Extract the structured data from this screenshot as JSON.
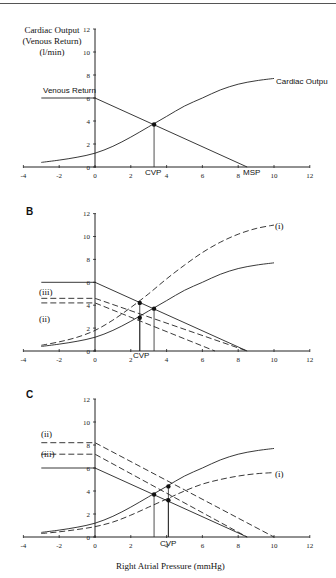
{
  "chart_data": [
    {
      "panel": "A",
      "type": "line",
      "ylabel": "Cardiac Output (Venous Return) (l/min)",
      "xlabel": "",
      "xlim": [
        -4,
        12
      ],
      "ylim": [
        0,
        12
      ],
      "xticks": [
        -4,
        -2,
        0,
        2,
        4,
        6,
        8,
        10,
        12
      ],
      "yticks": [
        0,
        2,
        4,
        6,
        8,
        10,
        12
      ],
      "grid": false,
      "series": [
        {
          "name": "Venous Return",
          "style": "solid",
          "x": [
            -3,
            0,
            8.5
          ],
          "y": [
            6,
            6,
            0
          ]
        },
        {
          "name": "Cardiac Output",
          "style": "solid",
          "x": [
            -3,
            -2,
            -1,
            0,
            1,
            2,
            3,
            4,
            5,
            6,
            7,
            8,
            9,
            10
          ],
          "y": [
            0.4,
            0.6,
            0.85,
            1.2,
            1.8,
            2.6,
            3.5,
            4.4,
            5.3,
            6.0,
            6.7,
            7.2,
            7.5,
            7.7
          ]
        }
      ],
      "annotations": [
        {
          "text": "Venous Return",
          "x": -3,
          "y": 6
        },
        {
          "text": "Cardiac Output",
          "x": 10,
          "y": 7.7
        },
        {
          "text": "CVP",
          "x": 3.3,
          "y": 0
        },
        {
          "text": "MSP",
          "x": 8.5,
          "y": 0
        }
      ],
      "points": [
        {
          "x": 3.3,
          "y": 3.7
        }
      ]
    },
    {
      "panel": "B",
      "type": "line",
      "xlim": [
        -4,
        12
      ],
      "ylim": [
        0,
        12
      ],
      "xticks": [
        -4,
        -2,
        0,
        2,
        4,
        6,
        8,
        10,
        12
      ],
      "yticks": [
        0,
        2,
        4,
        6,
        8,
        10,
        12
      ],
      "grid": false,
      "series": [
        {
          "name": "Venous Return",
          "style": "solid",
          "x": [
            -3,
            0,
            8.5
          ],
          "y": [
            6,
            6,
            0
          ]
        },
        {
          "name": "Cardiac Output",
          "style": "solid",
          "x": [
            -3,
            -2,
            -1,
            0,
            1,
            2,
            3,
            4,
            5,
            6,
            7,
            8,
            9,
            10
          ],
          "y": [
            0.4,
            0.6,
            0.85,
            1.2,
            1.8,
            2.6,
            3.5,
            4.4,
            5.3,
            6.0,
            6.7,
            7.2,
            7.5,
            7.7
          ]
        },
        {
          "name": "(i)",
          "style": "dashed",
          "x": [
            -3,
            -2,
            -1,
            0,
            1,
            2,
            3,
            4,
            5,
            6,
            7,
            8,
            9,
            10
          ],
          "y": [
            0.5,
            0.8,
            1.2,
            1.8,
            2.7,
            3.8,
            5.0,
            6.3,
            7.5,
            8.6,
            9.5,
            10.2,
            10.7,
            11.0
          ]
        },
        {
          "name": "(ii)",
          "style": "dashed",
          "x": [
            -3,
            0,
            6.7
          ],
          "y": [
            4.2,
            4.2,
            0
          ]
        },
        {
          "name": "(iii)",
          "style": "dashed",
          "x": [
            -3,
            0,
            8.5
          ],
          "y": [
            4.6,
            4.6,
            0
          ]
        }
      ],
      "annotations": [
        {
          "text": "(i)",
          "x": 10.3,
          "y": 11.0
        },
        {
          "text": "(ii)",
          "x": -3,
          "y": 3.5
        },
        {
          "text": "(iii)",
          "x": -3,
          "y": 5.2
        },
        {
          "text": "CVP",
          "x": 2.8,
          "y": 0
        }
      ],
      "points": [
        {
          "x": 2.5,
          "y": 4.2
        },
        {
          "x": 2.5,
          "y": 2.9
        },
        {
          "x": 3.3,
          "y": 3.7
        }
      ]
    },
    {
      "panel": "C",
      "type": "line",
      "xlabel": "Right Atrial Pressure (mmHg)",
      "xlim": [
        -4,
        12
      ],
      "ylim": [
        0,
        12
      ],
      "xticks": [
        -4,
        -2,
        0,
        2,
        4,
        6,
        8,
        10,
        12
      ],
      "yticks": [
        0,
        2,
        4,
        6,
        8,
        10,
        12
      ],
      "grid": false,
      "series": [
        {
          "name": "Venous Return",
          "style": "solid",
          "x": [
            -3,
            0,
            8.5
          ],
          "y": [
            6,
            6,
            0
          ]
        },
        {
          "name": "Cardiac Output",
          "style": "solid",
          "x": [
            -3,
            -2,
            -1,
            0,
            1,
            2,
            3,
            4,
            5,
            6,
            7,
            8,
            9,
            10
          ],
          "y": [
            0.4,
            0.6,
            0.85,
            1.2,
            1.8,
            2.6,
            3.5,
            4.4,
            5.3,
            6.0,
            6.7,
            7.2,
            7.5,
            7.7
          ]
        },
        {
          "name": "(i)",
          "style": "dashed",
          "x": [
            -3,
            -2,
            -1,
            0,
            1,
            2,
            3,
            4,
            5,
            6,
            7,
            8,
            9,
            10
          ],
          "y": [
            0.3,
            0.45,
            0.65,
            0.9,
            1.3,
            1.9,
            2.6,
            3.3,
            4.0,
            4.6,
            5.0,
            5.3,
            5.5,
            5.6
          ]
        },
        {
          "name": "(ii)",
          "style": "dashed",
          "x": [
            -3,
            0,
            10
          ],
          "y": [
            8.2,
            8.2,
            0
          ]
        },
        {
          "name": "(iii)",
          "style": "dashed",
          "x": [
            -3,
            0,
            8.5
          ],
          "y": [
            7.2,
            7.2,
            0
          ]
        }
      ],
      "annotations": [
        {
          "text": "(i)",
          "x": 10.3,
          "y": 5.6
        },
        {
          "text": "(ii)",
          "x": -3,
          "y": 8.8
        },
        {
          "text": "(iii)",
          "x": -3,
          "y": 6.8
        },
        {
          "text": "CVP",
          "x": 4.1,
          "y": 0
        }
      ],
      "points": [
        {
          "x": 3.3,
          "y": 3.7
        },
        {
          "x": 4.1,
          "y": 4.4
        },
        {
          "x": 4.1,
          "y": 3.2
        }
      ]
    }
  ],
  "labels": {
    "ylabel_lines": [
      "Cardiac Output",
      "(Venous Return)",
      "(l/min)"
    ],
    "xlabel": "Right Atrial Pressure (mmHg)",
    "panel_b": "B",
    "panel_c": "C",
    "venous_return": "Venous Return",
    "cardiac_output": "Cardiac Outpu",
    "cvp": "CVP",
    "msp": "MSP",
    "s1": "(i)",
    "s2": "(ii)",
    "s3": "(iii)"
  }
}
